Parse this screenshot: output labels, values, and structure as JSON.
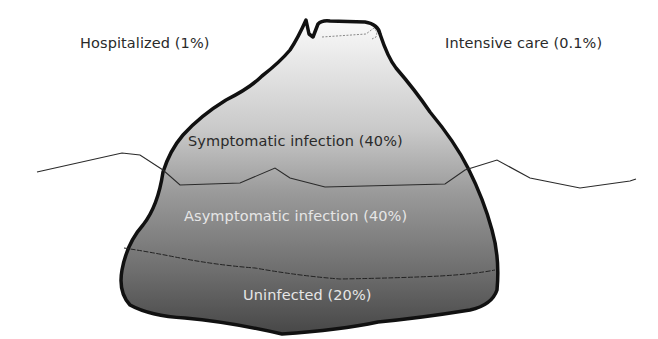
{
  "diagram": {
    "type": "iceberg",
    "labels": {
      "hospitalized": "Hospitalized (1%)",
      "intensive_care": "Intensive care (0.1%)",
      "symptomatic": "Symptomatic infection (40%)",
      "asymptomatic": "Asymptomatic infection (40%)",
      "uninfected": "Uninfected (20%)"
    },
    "layers": [
      {
        "name": "Intensive care",
        "percent": 0.1
      },
      {
        "name": "Hospitalized",
        "percent": 1
      },
      {
        "name": "Symptomatic infection",
        "percent": 40
      },
      {
        "name": "Asymptomatic infection",
        "percent": 40
      },
      {
        "name": "Uninfected",
        "percent": 20
      }
    ],
    "colors": {
      "outline": "#111111",
      "top_fill": "#f2f2f2",
      "mid_fill": "#a8a8a8",
      "bottom_fill": "#4a4a4a",
      "waterline": "#333333"
    }
  }
}
